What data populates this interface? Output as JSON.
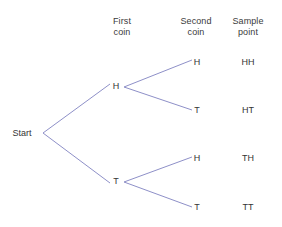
{
  "diagram": {
    "background_color": "#ffffff",
    "line_color": "#8e90c8",
    "text_color": "#343434",
    "headers": [
      {
        "id": "first-coin",
        "line1": "First",
        "line2": "coin",
        "x": 122,
        "y": 16
      },
      {
        "id": "second-coin",
        "line1": "Second",
        "line2": "coin",
        "x": 196,
        "y": 16
      },
      {
        "id": "sample-point",
        "line1": "Sample",
        "line2": "point",
        "x": 248,
        "y": 16
      }
    ],
    "nodes": [
      {
        "id": "start",
        "label": "Start",
        "x": 22,
        "y": 133
      },
      {
        "id": "first-h",
        "label": "H",
        "x": 116,
        "y": 86
      },
      {
        "id": "first-t",
        "label": "T",
        "x": 116,
        "y": 181
      },
      {
        "id": "second-hh",
        "label": "H",
        "x": 197,
        "y": 62
      },
      {
        "id": "second-ht",
        "label": "T",
        "x": 197,
        "y": 110
      },
      {
        "id": "second-th",
        "label": "H",
        "x": 197,
        "y": 158
      },
      {
        "id": "second-tt",
        "label": "T",
        "x": 197,
        "y": 207
      }
    ],
    "sample_points": [
      {
        "id": "sample-hh",
        "label": "HH",
        "x": 248,
        "y": 62
      },
      {
        "id": "sample-ht",
        "label": "HT",
        "x": 248,
        "y": 110
      },
      {
        "id": "sample-th",
        "label": "TH",
        "x": 248,
        "y": 158
      },
      {
        "id": "sample-tt",
        "label": "TT",
        "x": 248,
        "y": 207
      }
    ],
    "edges": [
      {
        "id": "edge-start-h",
        "from": "start",
        "to": "first-h",
        "x1": 43,
        "y1": 133,
        "x2": 110,
        "y2": 84
      },
      {
        "id": "edge-start-t",
        "from": "start",
        "to": "first-t",
        "x1": 43,
        "y1": 133,
        "x2": 110,
        "y2": 183
      },
      {
        "id": "edge-h-h",
        "from": "first-h",
        "to": "second-hh",
        "x1": 124,
        "y1": 87,
        "x2": 192,
        "y2": 60
      },
      {
        "id": "edge-h-t",
        "from": "first-h",
        "to": "second-ht",
        "x1": 124,
        "y1": 87,
        "x2": 192,
        "y2": 110
      },
      {
        "id": "edge-t-h",
        "from": "first-t",
        "to": "second-th",
        "x1": 124,
        "y1": 182,
        "x2": 192,
        "y2": 157
      },
      {
        "id": "edge-t-t",
        "from": "first-t",
        "to": "second-tt",
        "x1": 124,
        "y1": 182,
        "x2": 192,
        "y2": 207
      }
    ]
  },
  "chart_data": {
    "type": "tree",
    "columns": [
      "First coin",
      "Second coin",
      "Sample point"
    ],
    "root": "Start",
    "branches": [
      {
        "first": "H",
        "second": "H",
        "sample_point": "HH"
      },
      {
        "first": "H",
        "second": "T",
        "sample_point": "HT"
      },
      {
        "first": "T",
        "second": "H",
        "sample_point": "TH"
      },
      {
        "first": "T",
        "second": "T",
        "sample_point": "TT"
      }
    ]
  }
}
